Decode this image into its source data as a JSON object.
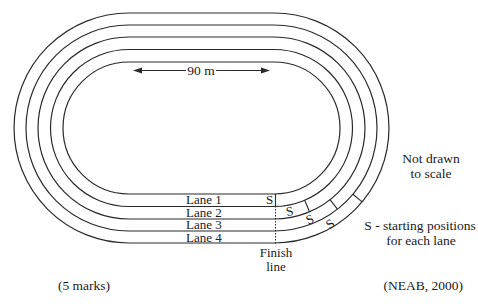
{
  "diagram": {
    "lane_count": 4,
    "boundary_count": 5,
    "straight_label": "90 m",
    "lanes": [
      {
        "label": "Lane 1",
        "start_marker": "S"
      },
      {
        "label": "Lane 2",
        "start_marker": "S"
      },
      {
        "label": "Lane 3",
        "start_marker": "S"
      },
      {
        "label": "Lane 4",
        "start_marker": "S"
      }
    ],
    "finish_label_line1": "Finish",
    "finish_label_line2": "line",
    "scale_note_line1": "Not drawn",
    "scale_note_line2": "to scale",
    "legend_line1": "S - starting positions",
    "legend_line2": "for each lane",
    "stroke_color": "#2a2a2a"
  },
  "footer": {
    "marks": "(5 marks)",
    "source": "(NEAB, 2000)"
  }
}
